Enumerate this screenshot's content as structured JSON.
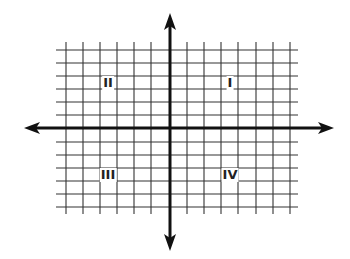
{
  "diagram": {
    "type": "coordinate-plane",
    "colors": {
      "background": "#ffffff",
      "grid": "#333333",
      "axes": "#111111",
      "label": "#222222"
    },
    "quadrants": [
      {
        "id": "I",
        "label": "I"
      },
      {
        "id": "II",
        "label": "II"
      },
      {
        "id": "III",
        "label": "III"
      },
      {
        "id": "IV",
        "label": "IV"
      }
    ]
  }
}
